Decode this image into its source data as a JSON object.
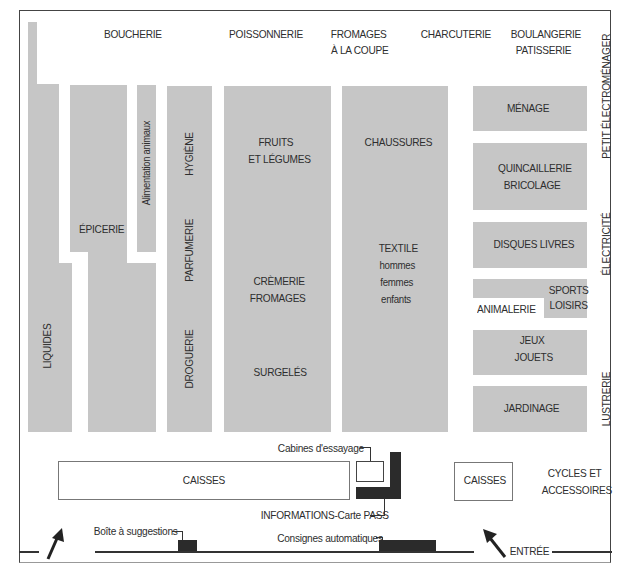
{
  "plan": {
    "top_labels": {
      "boucherie": "BOUCHERIE",
      "poissonnerie": "POISSONNERIE",
      "fromages_1": "FROMAGES",
      "fromages_2": "À LA COUPE",
      "charcuterie": "CHARCUTERIE",
      "boulangerie_1": "BOULANGERIE",
      "boulangerie_2": "PATISSERIE"
    },
    "side_labels": {
      "petit_electromenager": "PETIT ÉLECTROMÉNAGER",
      "electricite": "ÉLECTRICITÉ",
      "lustrerie": "LUSTRERIE"
    },
    "aisles": {
      "liquides": "LIQUIDES",
      "epicerie": "ÉPICERIE",
      "alimentation_animaux": "Alimentation animaux",
      "hygiene": "HYGIÈNE",
      "parfumerie": "PARFUMERIE",
      "droguerie": "DROGUERIE",
      "fruits_1": "FRUITS",
      "fruits_2": "ET LÉGUMES",
      "cremerie_1": "CRÈMERIE",
      "cremerie_2": "FROMAGES",
      "surgeles": "SURGELÉS",
      "chaussures": "CHAUSSURES",
      "textile_1": "TEXTILE",
      "textile_2": "hommes",
      "textile_3": "femmes",
      "textile_4": "enfants",
      "menage": "MÉNAGE",
      "quincaillerie_1": "QUINCAILLERIE",
      "quincaillerie_2": "BRICOLAGE",
      "disques": "DISQUES LIVRES",
      "sports_1": "SPORTS",
      "sports_2": "LOISIRS",
      "animalerie": "ANIMALERIE",
      "jeux_1": "JEUX",
      "jeux_2": "JOUETS",
      "jardinage": "JARDINAGE"
    },
    "bottom": {
      "caisses_main": "CAISSES",
      "caisses_small": "CAISSES",
      "cabines": "Cabines d'essayage",
      "informations": "INFORMATIONS-Carte PASS",
      "cycles_1": "CYCLES ET",
      "cycles_2": "ACCESSOIRES",
      "boite": "Boîte à suggestions",
      "consignes": "Consignes automatiques",
      "entree": "ENTRÉE"
    },
    "colors": {
      "shelf": "#c6c6c6",
      "dark": "#2b2b2b",
      "frame": "#444444"
    }
  }
}
